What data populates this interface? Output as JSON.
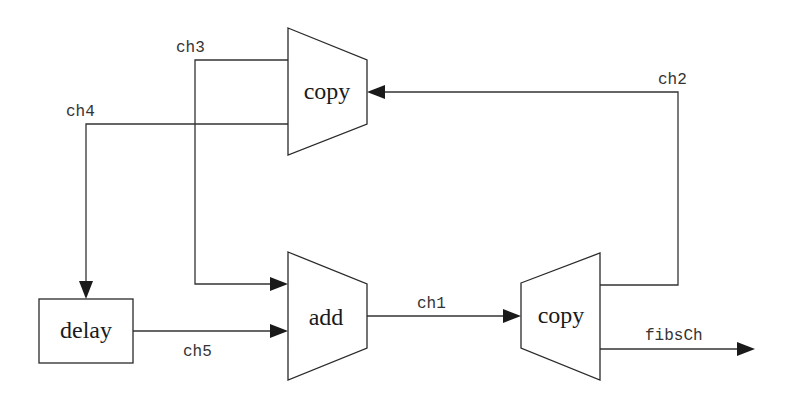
{
  "diagram": {
    "type": "dataflow",
    "blocks": {
      "copy_top": {
        "label": "copy",
        "shape": "trapezoid"
      },
      "add": {
        "label": "add",
        "shape": "trapezoid"
      },
      "copy_right": {
        "label": "copy",
        "shape": "trapezoid"
      },
      "delay": {
        "label": "delay",
        "shape": "rectangle"
      }
    },
    "channels": {
      "ch1": {
        "label": "ch1",
        "from": "add",
        "to": "copy_right"
      },
      "ch2": {
        "label": "ch2",
        "from": "copy_right",
        "to": "copy_top"
      },
      "ch3": {
        "label": "ch3",
        "from": "copy_top",
        "to": "add"
      },
      "ch4": {
        "label": "ch4",
        "from": "copy_top",
        "to": "delay"
      },
      "ch5": {
        "label": "ch5",
        "from": "delay",
        "to": "add"
      },
      "fibsCh": {
        "label": "fibsCh",
        "from": "copy_right",
        "to": "output"
      }
    },
    "colors": {
      "line": "#333333",
      "arrow": "#1a1a1a",
      "background": "#ffffff"
    }
  }
}
